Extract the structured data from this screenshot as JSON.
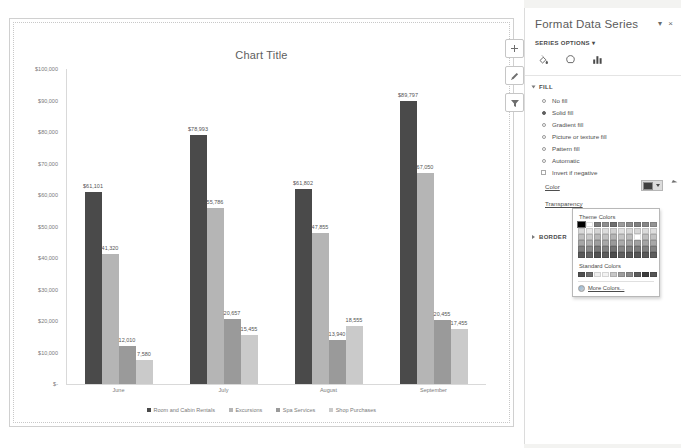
{
  "chart_object": {
    "title": "Chart Title",
    "buttons": [
      {
        "name": "chart-elements-button",
        "glyph": "+"
      },
      {
        "name": "chart-styles-button",
        "glyph": "brush"
      },
      {
        "name": "chart-filters-button",
        "glyph": "funnel"
      }
    ]
  },
  "chart_data": {
    "type": "bar",
    "title": "Chart Title",
    "xlabel": "",
    "ylabel": "",
    "ylim": [
      0,
      100000
    ],
    "grid": false,
    "legend_position": "bottom",
    "categories": [
      "June",
      "July",
      "August",
      "September"
    ],
    "ytick_labels": [
      "$100,000",
      "$90,000",
      "$80,000",
      "$70,000",
      "$60,000",
      "$50,000",
      "$40,000",
      "$30,000",
      "$20,000",
      "$10,000",
      "$-"
    ],
    "ytick_values": [
      100000,
      90000,
      80000,
      70000,
      60000,
      50000,
      40000,
      30000,
      20000,
      10000,
      0
    ],
    "series": [
      {
        "name": "Room and Cabin Rentals",
        "color": "#4a4a4a",
        "values": [
          61101,
          78993,
          61802,
          89797
        ],
        "labels": [
          "$61,101",
          "$78,993",
          "$61,802",
          "$89,797"
        ]
      },
      {
        "name": "Excursions",
        "color": "#b5b5b5",
        "values": [
          41320,
          55786,
          47855,
          67050
        ],
        "labels": [
          "41,320",
          "55,786",
          "47,855",
          "67,050"
        ]
      },
      {
        "name": "Spa Services",
        "color": "#9a9a9a",
        "values": [
          12010,
          20657,
          13940,
          20455
        ],
        "labels": [
          "12,010",
          "20,657",
          "13,940",
          "20,455"
        ]
      },
      {
        "name": "Shop Purchases",
        "color": "#cacaca",
        "values": [
          7580,
          15455,
          18555,
          17455
        ],
        "labels": [
          "7,580",
          "15,455",
          "18,555",
          "17,455"
        ]
      }
    ]
  },
  "pane": {
    "title": "Format Data Series",
    "close_glyph": "×",
    "menu_glyph": "▾",
    "subtitle": "SERIES OPTIONS",
    "subtitle_caret": "▾",
    "icons": [
      {
        "name": "fill-and-line-icon",
        "label": "Fill & Line"
      },
      {
        "name": "effects-icon",
        "label": "Effects"
      },
      {
        "name": "series-options-icon",
        "label": "Series Options"
      }
    ],
    "fill_section": {
      "heading": "FILL",
      "options": [
        {
          "label": "No fill",
          "selected": false
        },
        {
          "label": "Solid fill",
          "selected": true
        },
        {
          "label": "Gradient fill",
          "selected": false
        },
        {
          "label": "Picture or texture fill",
          "selected": false
        },
        {
          "label": "Pattern fill",
          "selected": false
        },
        {
          "label": "Automatic",
          "selected": false
        }
      ],
      "invert_if_negative": "Invert if negative",
      "color_label": "Color",
      "transparency_label": "Transparency"
    },
    "border_section": {
      "heading": "BORDER"
    }
  },
  "color_picker": {
    "theme_label": "Theme Colors",
    "standard_label": "Standard Colors",
    "more_colors_label": "More Colors...",
    "theme_row_top": [
      "#000000",
      "#ffffff",
      "#7a7a7a",
      "#8f8f8f",
      "#6e6e6e",
      "#9b9b9b",
      "#8a8a8a",
      "#7f7f7f",
      "#868686",
      "#949494"
    ],
    "theme_rows": [
      [
        "#d9d9d9",
        "#e8e8e8",
        "#d4d4d4",
        "#dcdcdc",
        "#d0d0d0",
        "#e0e0e0",
        "#d8d8d8",
        "#d6d6d6",
        "#dadada",
        "#dedede"
      ],
      [
        "#bfbfbf",
        "#c9c9c9",
        "#b8b8b8",
        "#c1c1c1",
        "#b4b4b4",
        "#c4c4c4",
        "#bcbcbc",
        "#babab a",
        "#bebebe",
        "#c2c2c2"
      ],
      [
        "#a6a6a6",
        "#adadad",
        "#9e9e9e",
        "#a8a8a8",
        "#9a9a9a",
        "#aaaaaa",
        "#a2a2a2",
        "#a0a0a0",
        "#a4a4a4",
        "#a8a8a8"
      ],
      [
        "#808080",
        "#8a8a8a",
        "#787878",
        "#828282",
        "#747474",
        "#868686",
        "#7e7e7e",
        "#7c7c7c",
        "#808080",
        "#848484"
      ],
      [
        "#595959",
        "#636363",
        "#515151",
        "#5b5b5b",
        "#4d4d4d",
        "#5f5f5f",
        "#575757",
        "#555555",
        "#595959",
        "#5d5d5d"
      ]
    ],
    "standard_colors": [
      "#4f4f4f",
      "#6d6d6d",
      "#efefef",
      "#f2f2f2",
      "#c7c7c7",
      "#9d9d9d",
      "#8a8a8a",
      "#5c5c5c",
      "#3d3d3d",
      "#555555"
    ],
    "selected_index": 0
  }
}
